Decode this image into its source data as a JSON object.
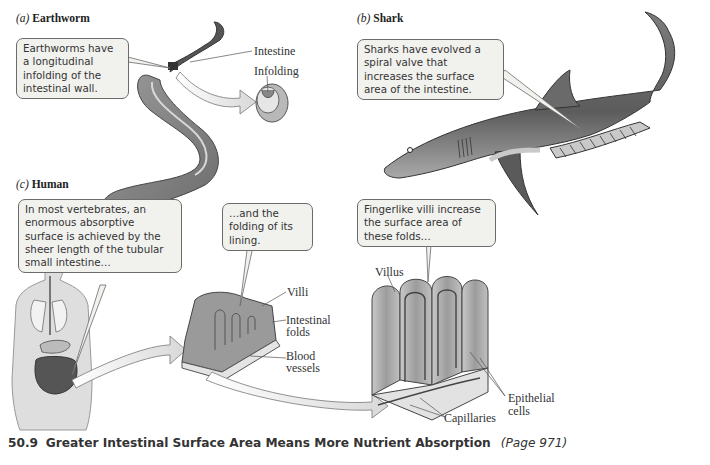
{
  "panels": {
    "a": {
      "letter": "(a)",
      "name": "Earthworm",
      "callout": "Earthworms have a longitudinal infolding of the intestinal wall.",
      "labels": {
        "intestine": "Intestine",
        "infolding": "Infolding"
      }
    },
    "b": {
      "letter": "(b)",
      "name": "Shark",
      "callout": "Sharks have evolved a spiral valve that increases the surface area of the intestine."
    },
    "c": {
      "letter": "(c)",
      "name": "Human",
      "callouts": {
        "length": "In most vertebrates, an enormous absorptive surface is achieved by the sheer length of the tubular small intestine…",
        "folding": "…and the folding of its lining.",
        "villi": "Fingerlike villi increase the surface area of these folds…"
      },
      "labels": {
        "villi": "Villi",
        "intestinal_folds_1": "Intestinal",
        "intestinal_folds_2": "folds",
        "blood_vessels_1": "Blood",
        "blood_vessels_2": "vessels",
        "villus": "Villus",
        "epithelial_1": "Epithelial",
        "epithelial_2": "cells",
        "capillaries": "Capillaries"
      }
    }
  },
  "caption": {
    "number": "50.9",
    "title": "Greater Intestinal Surface Area Means More Nutrient Absorption",
    "page": "(Page 971)"
  },
  "colors": {
    "callout_fill": "#f1f1ee",
    "callout_border": "#6b6b6b",
    "illustration_gray": "#8a8a8a",
    "text": "#333333"
  }
}
